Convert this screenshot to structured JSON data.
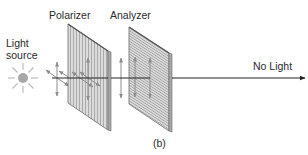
{
  "labels": {
    "light_source_line1": "Light",
    "light_source_line2": "source",
    "polarizer": "Polarizer",
    "analyzer": "Analyzer",
    "output": "No Light",
    "caption": "(b)"
  },
  "colors": {
    "panel_fill": "#d4d4d4",
    "panel_stripe": "#9a9a9a",
    "panel_edge": "#6a6a6a",
    "axis": "#222222",
    "vector": "#8c8c8c",
    "source": "#a6a6a6"
  }
}
